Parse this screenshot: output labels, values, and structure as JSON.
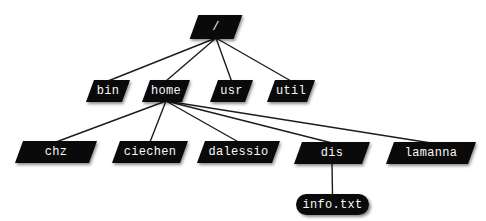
{
  "diagram": {
    "type": "tree",
    "colors": {
      "node_fill": "#0a0a0a",
      "node_text": "#f8f8f8",
      "edge": "#1c1c1c",
      "background": "#ffffff"
    },
    "nodes": [
      {
        "id": "root",
        "label": "/",
        "parent": null,
        "shape": "parallelogram"
      },
      {
        "id": "bin",
        "label": "bin",
        "parent": "root",
        "shape": "parallelogram"
      },
      {
        "id": "home",
        "label": "home",
        "parent": "root",
        "shape": "parallelogram"
      },
      {
        "id": "usr",
        "label": "usr",
        "parent": "root",
        "shape": "parallelogram"
      },
      {
        "id": "util",
        "label": "util",
        "parent": "root",
        "shape": "parallelogram"
      },
      {
        "id": "chz",
        "label": "chz",
        "parent": "home",
        "shape": "parallelogram"
      },
      {
        "id": "ciechen",
        "label": "ciechen",
        "parent": "home",
        "shape": "parallelogram"
      },
      {
        "id": "dalessio",
        "label": "dalessio",
        "parent": "home",
        "shape": "parallelogram"
      },
      {
        "id": "dis",
        "label": "dis",
        "parent": "home",
        "shape": "parallelogram"
      },
      {
        "id": "lamanna",
        "label": "lamanna",
        "parent": "home",
        "shape": "parallelogram"
      },
      {
        "id": "info",
        "label": "info.txt",
        "parent": "dis",
        "shape": "rounded"
      }
    ]
  }
}
